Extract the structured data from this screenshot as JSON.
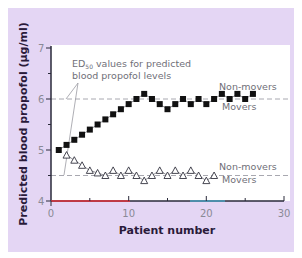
{
  "chart_data": {
    "type": "scatter",
    "title": "",
    "xlabel": "Patient number",
    "ylabel": "Predicted blood propofol (µg/ml)",
    "xlim": [
      0,
      30
    ],
    "ylim": [
      4,
      7
    ],
    "x_ticks": [
      0,
      10,
      20,
      30
    ],
    "y_ticks": [
      4,
      5,
      6,
      7
    ],
    "grid": false,
    "annotation": {
      "line1": "ED",
      "subscript": "50",
      "line1_rest": " values for predicted",
      "line2": "blood propofol levels"
    },
    "reference_lines": [
      {
        "name": "Non-movers ED50",
        "y": 6.0,
        "label_above": "Non-movers",
        "label_below": "Movers"
      },
      {
        "name": "Movers ED50",
        "y": 4.5,
        "label_above": "Non-movers",
        "label_below": "Movers"
      }
    ],
    "series": [
      {
        "name": "Non-movers",
        "marker": "filled-square",
        "x": [
          1,
          2,
          3,
          4,
          5,
          6,
          7,
          8,
          9,
          10,
          11,
          12,
          13,
          14,
          15,
          16,
          17,
          18,
          19,
          20,
          21,
          22,
          23,
          24,
          25,
          26
        ],
        "values": [
          5.0,
          5.1,
          5.2,
          5.3,
          5.4,
          5.5,
          5.6,
          5.7,
          5.8,
          5.9,
          6.0,
          6.1,
          6.0,
          5.9,
          5.8,
          5.9,
          6.0,
          5.9,
          6.0,
          5.9,
          6.0,
          6.1,
          6.0,
          6.1,
          6.0,
          6.1
        ]
      },
      {
        "name": "Movers",
        "marker": "open-triangle",
        "x": [
          2,
          3,
          4,
          5,
          6,
          7,
          8,
          9,
          10,
          11,
          12,
          13,
          14,
          15,
          16,
          17,
          18,
          19,
          20,
          21
        ],
        "values": [
          4.9,
          4.8,
          4.7,
          4.6,
          4.55,
          4.5,
          4.6,
          4.5,
          4.6,
          4.5,
          4.4,
          4.5,
          4.6,
          4.5,
          4.6,
          4.5,
          4.6,
          4.5,
          4.4,
          4.5
        ]
      }
    ]
  },
  "colors": {
    "panel_bg": "#e4d6f4",
    "plot_bg": "#ffffff",
    "axis": "#2a2a3a",
    "dashed": "#a8a8b0",
    "x_axis_accent": "#e0303a"
  },
  "labels": {
    "ylabel": "Predicted blood propofol (µg/ml)",
    "xlabel": "Patient number",
    "y7": "7",
    "y6": "6",
    "y5": "5",
    "y4": "4",
    "x0": "0",
    "x10": "10",
    "x20": "20",
    "x30": "30",
    "annot_ed": "ED",
    "annot_sub": "50",
    "annot_rest": " values for predicted",
    "annot_line2": "blood propofol levels",
    "upper_nonmovers": "Non-movers",
    "upper_movers": "Movers",
    "lower_nonmovers": "Non-movers",
    "lower_movers": "Movers"
  }
}
